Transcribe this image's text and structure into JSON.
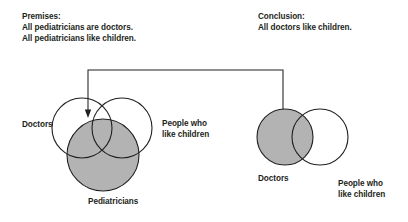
{
  "figure": {
    "title_premises": "Premises:",
    "premises": [
      "All pediatricians are doctors.",
      "All pediatricians like children."
    ],
    "title_conclusion": "Conclusion:",
    "conclusion": [
      "All doctors like children."
    ],
    "left_diagram": {
      "name": "premises-venn-diagram",
      "labels": {
        "doctors": "Doctors",
        "people_line1": "People who",
        "people_line2": "like children",
        "pediatricians": "Pediatricians"
      },
      "shaded_set": "Pediatricians",
      "shade_color": "#b3b3b3",
      "stroke_color": "#231f20"
    },
    "right_diagram": {
      "name": "conclusion-venn-diagram",
      "labels": {
        "doctors": "Doctors",
        "people_line1": "People who",
        "people_line2": "like children"
      },
      "shaded_set": "Doctors",
      "shade_color": "#b3b3b3",
      "stroke_color": "#231f20"
    },
    "connector": {
      "from": "premises-venn-diagram",
      "to": "conclusion-venn-diagram",
      "style": "double-headed-bracket-arrow"
    }
  }
}
